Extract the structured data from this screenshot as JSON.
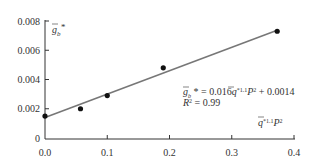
{
  "chart_data": {
    "type": "scatter",
    "title": "",
    "xlabel": "q̄*1.1 P²",
    "ylabel": "ḡb*",
    "xlim": [
      0.0,
      0.4
    ],
    "ylim": [
      0,
      0.008
    ],
    "x_ticks": [
      "0.0",
      "0.1",
      "0.2",
      "0.3",
      "0.4"
    ],
    "y_ticks": [
      "0",
      "0.002",
      "0.004",
      "0.006",
      "0.008"
    ],
    "grid": false,
    "series": [
      {
        "name": "data",
        "kind": "points",
        "x": [
          0.0,
          0.057,
          0.1,
          0.19,
          0.373
        ],
        "y": [
          0.0015,
          0.002,
          0.0029,
          0.0048,
          0.0073
        ]
      },
      {
        "name": "linear fit",
        "kind": "line",
        "slope": 0.016,
        "intercept": 0.0014,
        "x": [
          0.0,
          0.373
        ],
        "y": [
          0.0014,
          0.00737
        ]
      }
    ],
    "annotations": {
      "equation": "ḡb* = 0.016q̄*1.1 P² + 0.0014",
      "r_squared": "R² = 0.99"
    },
    "colors": {
      "line": "#777777",
      "points": "#111111",
      "axis": "#333333"
    }
  }
}
